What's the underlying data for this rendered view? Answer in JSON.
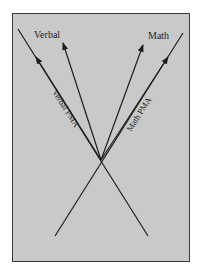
{
  "diagram": {
    "type": "vector-diagram",
    "background_color": "#c9c9c9",
    "line_color": "#1e1e1e",
    "labels": {
      "verbal": "Verbal",
      "math": "Math",
      "verbal_pma": "Verbal PMA",
      "math_pma": "Math PMA"
    },
    "vectors": [
      {
        "name": "Verbal",
        "role": "arrow"
      },
      {
        "name": "Math",
        "role": "arrow"
      },
      {
        "name": "Verbal PMA",
        "role": "axis-line"
      },
      {
        "name": "Math PMA",
        "role": "axis-line"
      }
    ]
  }
}
